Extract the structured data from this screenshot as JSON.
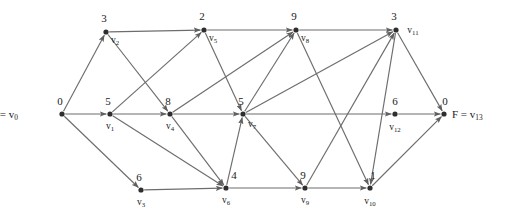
{
  "figure": {
    "kind": "directed-acyclic-graph",
    "source_label": "S = v",
    "source_subscript": "0",
    "sink_label": "F = v",
    "sink_subscript": "13",
    "arrow_color": "#6d6d6d",
    "node_color": "#2e2e2e",
    "text_color": "#1a1a1a",
    "background": "#ffffff"
  },
  "nodes": [
    {
      "id": "v0",
      "name": "v",
      "sub": "0",
      "weight": "0",
      "x": 62,
      "y": 114,
      "weight_dx": -2,
      "weight_dy": -9,
      "name_dx": -17,
      "name_dy": 2,
      "show_name": false
    },
    {
      "id": "v1",
      "name": "v",
      "sub": "1",
      "weight": "5",
      "x": 110,
      "y": 114,
      "weight_dx": -2,
      "weight_dy": -9,
      "name_dx": 0,
      "name_dy": 15,
      "show_name": true
    },
    {
      "id": "v2",
      "name": "v",
      "sub": "2",
      "weight": "3",
      "x": 106,
      "y": 32,
      "weight_dx": -2,
      "weight_dy": -10,
      "name_dx": 9,
      "name_dy": 11,
      "show_name": true
    },
    {
      "id": "v3",
      "name": "v",
      "sub": "3",
      "weight": "6",
      "x": 141,
      "y": 190,
      "weight_dx": -2,
      "weight_dy": -9,
      "name_dx": 0,
      "name_dy": 15,
      "show_name": true
    },
    {
      "id": "v4",
      "name": "v",
      "sub": "4",
      "weight": "8",
      "x": 170,
      "y": 114,
      "weight_dx": -2,
      "weight_dy": -9,
      "name_dx": 0,
      "name_dy": 15,
      "show_name": true
    },
    {
      "id": "v5",
      "name": "v",
      "sub": "5",
      "weight": "2",
      "x": 204,
      "y": 30,
      "weight_dx": -2,
      "weight_dy": -10,
      "name_dx": 9,
      "name_dy": 11,
      "show_name": true
    },
    {
      "id": "v6",
      "name": "v",
      "sub": "6",
      "weight": "4",
      "x": 226,
      "y": 188,
      "weight_dx": 8,
      "weight_dy": -9,
      "name_dx": 0,
      "name_dy": 15,
      "show_name": true
    },
    {
      "id": "v7",
      "name": "v",
      "sub": "7",
      "weight": "5",
      "x": 243,
      "y": 114,
      "weight_dx": -2,
      "weight_dy": -9,
      "name_dx": 9,
      "name_dy": 13,
      "show_name": true
    },
    {
      "id": "v8",
      "name": "v",
      "sub": "8",
      "weight": "9",
      "x": 296,
      "y": 30,
      "weight_dx": -2,
      "weight_dy": -10,
      "name_dx": 9,
      "name_dy": 11,
      "show_name": true
    },
    {
      "id": "v9",
      "name": "v",
      "sub": "9",
      "weight": "9",
      "x": 305,
      "y": 188,
      "weight_dx": -2,
      "weight_dy": -9,
      "name_dx": 0,
      "name_dy": 15,
      "show_name": true
    },
    {
      "id": "v10",
      "name": "v",
      "sub": "10",
      "weight": "1",
      "x": 370,
      "y": 188,
      "weight_dx": 3,
      "weight_dy": -9,
      "name_dx": 0,
      "name_dy": 16,
      "show_name": true
    },
    {
      "id": "v11",
      "name": "v",
      "sub": "11",
      "weight": "3",
      "x": 396,
      "y": 30,
      "weight_dx": -2,
      "weight_dy": -10,
      "name_dx": 17,
      "name_dy": 3,
      "show_name": true
    },
    {
      "id": "v12",
      "name": "v",
      "sub": "12",
      "weight": "6",
      "x": 395,
      "y": 114,
      "weight_dx": 0,
      "weight_dy": -9,
      "name_dx": 0,
      "name_dy": 16,
      "show_name": true
    },
    {
      "id": "v13",
      "name": "v",
      "sub": "13",
      "weight": "0",
      "x": 444,
      "y": 114,
      "weight_dx": 1,
      "weight_dy": -9,
      "name_dx": 0,
      "name_dy": 15,
      "show_name": false
    }
  ],
  "edges": [
    {
      "from": "v0",
      "to": "v2"
    },
    {
      "from": "v0",
      "to": "v1"
    },
    {
      "from": "v0",
      "to": "v3"
    },
    {
      "from": "v2",
      "to": "v5"
    },
    {
      "from": "v2",
      "to": "v4"
    },
    {
      "from": "v1",
      "to": "v5"
    },
    {
      "from": "v1",
      "to": "v4"
    },
    {
      "from": "v1",
      "to": "v6"
    },
    {
      "from": "v3",
      "to": "v6"
    },
    {
      "from": "v4",
      "to": "v8"
    },
    {
      "from": "v4",
      "to": "v7"
    },
    {
      "from": "v4",
      "to": "v6"
    },
    {
      "from": "v5",
      "to": "v8"
    },
    {
      "from": "v5",
      "to": "v7"
    },
    {
      "from": "v6",
      "to": "v7"
    },
    {
      "from": "v6",
      "to": "v9"
    },
    {
      "from": "v7",
      "to": "v8"
    },
    {
      "from": "v7",
      "to": "v11"
    },
    {
      "from": "v7",
      "to": "v12"
    },
    {
      "from": "v7",
      "to": "v9"
    },
    {
      "from": "v8",
      "to": "v11"
    },
    {
      "from": "v8",
      "to": "v10"
    },
    {
      "from": "v9",
      "to": "v11"
    },
    {
      "from": "v9",
      "to": "v10"
    },
    {
      "from": "v11",
      "to": "v10"
    },
    {
      "from": "v11",
      "to": "v13"
    },
    {
      "from": "v10",
      "to": "v13"
    },
    {
      "from": "v12",
      "to": "v13"
    }
  ],
  "terminals": {
    "source": {
      "x": 18,
      "y": 118,
      "text": "S = v",
      "sub": "0"
    },
    "sink": {
      "x": 452,
      "y": 118,
      "text": "F = v",
      "sub": "13"
    }
  }
}
